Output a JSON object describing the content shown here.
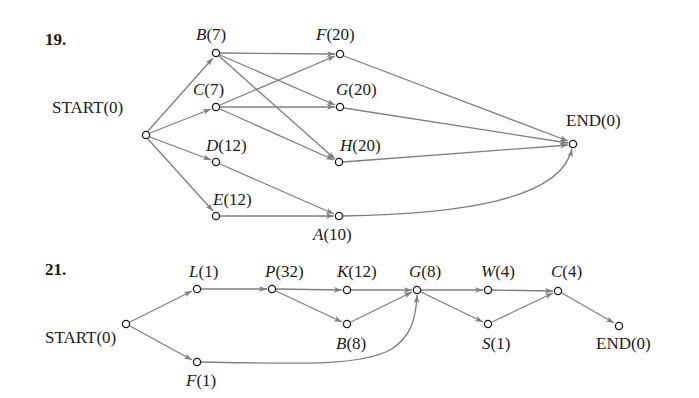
{
  "colors": {
    "edge": "#7f7f7f",
    "node_stroke": "#1a1a1a",
    "text": "#1a1a1a",
    "background": "#ffffff"
  },
  "diagrams": [
    {
      "number": "19.",
      "nodes": {
        "start": {
          "letter": "",
          "label": "START(0)",
          "x": 146,
          "y": 135
        },
        "B": {
          "letter": "B",
          "value": "(7)",
          "x": 216,
          "y": 53
        },
        "C": {
          "letter": "C",
          "value": "(7)",
          "x": 216,
          "y": 107
        },
        "D": {
          "letter": "D",
          "value": "(12)",
          "x": 216,
          "y": 162
        },
        "E": {
          "letter": "E",
          "value": "(12)",
          "x": 216,
          "y": 216
        },
        "F": {
          "letter": "F",
          "value": "(20)",
          "x": 340,
          "y": 54
        },
        "G": {
          "letter": "G",
          "value": "(20)",
          "x": 340,
          "y": 107
        },
        "H": {
          "letter": "H",
          "value": "(20)",
          "x": 339,
          "y": 162
        },
        "A": {
          "letter": "A",
          "value": "(10)",
          "x": 339,
          "y": 216
        },
        "end": {
          "letter": "",
          "label": "END(0)",
          "x": 573,
          "y": 144
        }
      },
      "edges": [
        [
          "START",
          "B"
        ],
        [
          "START",
          "C"
        ],
        [
          "START",
          "D"
        ],
        [
          "START",
          "E"
        ],
        [
          "B",
          "F"
        ],
        [
          "B",
          "G"
        ],
        [
          "B",
          "H"
        ],
        [
          "C",
          "F"
        ],
        [
          "C",
          "G"
        ],
        [
          "C",
          "H"
        ],
        [
          "D",
          "A"
        ],
        [
          "E",
          "A"
        ],
        [
          "F",
          "END"
        ],
        [
          "G",
          "END"
        ],
        [
          "H",
          "END"
        ],
        [
          "A",
          "END"
        ]
      ]
    },
    {
      "number": "21.",
      "nodes": {
        "start": {
          "letter": "",
          "label": "START(0)",
          "x": 126,
          "y": 324
        },
        "L": {
          "letter": "L",
          "value": "(1)",
          "x": 197,
          "y": 289
        },
        "F": {
          "letter": "F",
          "value": "(1)",
          "x": 197,
          "y": 362
        },
        "P": {
          "letter": "P",
          "value": "(32)",
          "x": 272,
          "y": 289
        },
        "K": {
          "letter": "K",
          "value": "(12)",
          "x": 347,
          "y": 290
        },
        "B": {
          "letter": "B",
          "value": "(8)",
          "x": 347,
          "y": 324
        },
        "G": {
          "letter": "G",
          "value": "(8)",
          "x": 417,
          "y": 290
        },
        "W": {
          "letter": "W",
          "value": "(4)",
          "x": 488,
          "y": 290
        },
        "S": {
          "letter": "S",
          "value": "(1)",
          "x": 488,
          "y": 324
        },
        "C": {
          "letter": "C",
          "value": "(4)",
          "x": 558,
          "y": 291
        },
        "end": {
          "letter": "",
          "label": "END(0)",
          "x": 619,
          "y": 326
        }
      },
      "edges": [
        [
          "START",
          "L"
        ],
        [
          "START",
          "F"
        ],
        [
          "L",
          "P"
        ],
        [
          "P",
          "K"
        ],
        [
          "P",
          "B"
        ],
        [
          "K",
          "G"
        ],
        [
          "B",
          "G"
        ],
        [
          "F",
          "G"
        ],
        [
          "G",
          "W"
        ],
        [
          "G",
          "S"
        ],
        [
          "W",
          "C"
        ],
        [
          "S",
          "C"
        ],
        [
          "C",
          "END"
        ]
      ]
    }
  ]
}
